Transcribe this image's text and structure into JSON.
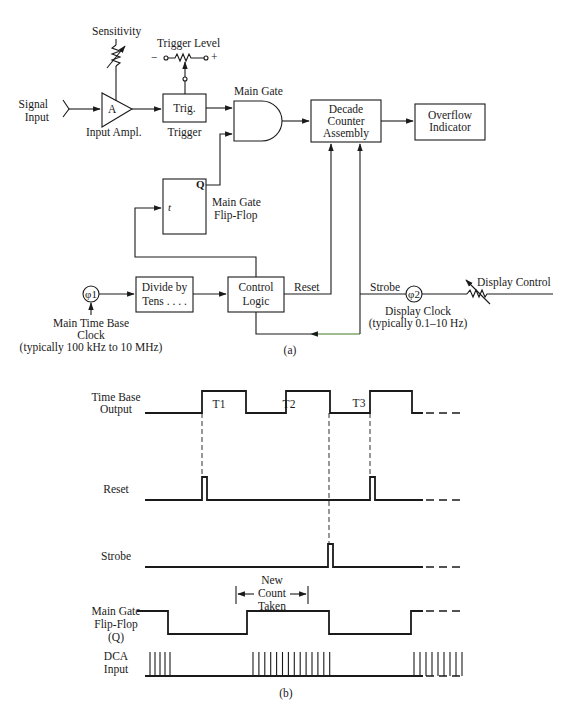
{
  "figure": {
    "part_a": {
      "caption": "(a)",
      "signal_input": [
        "Signal",
        "Input"
      ],
      "sensitivity_label": "Sensitivity",
      "amplifier_symbol": "A",
      "amplifier_label": "Input Ampl.",
      "trigger_level_label": "Trigger Level",
      "trigger_level_minus": "−",
      "trigger_level_plus": "+",
      "trigger_box": "Trig.",
      "trigger_label": "Trigger",
      "main_gate_label": "Main Gate",
      "decade_counter": [
        "Decade",
        "Counter",
        "Assembly"
      ],
      "overflow_indicator": [
        "Overflow",
        "Indicator"
      ],
      "flipflop_q": "Q",
      "flipflop_t": "t",
      "flipflop_label": [
        "Main Gate",
        "Flip-Flop"
      ],
      "clock1_symbol": "φ1",
      "clock1_label": [
        "Main Time Base",
        "Clock",
        "(typically 100 kHz to 10 MHz)"
      ],
      "divide_box": [
        "Divide by",
        "Tens . . . ."
      ],
      "control_logic": [
        "Control",
        "Logic"
      ],
      "reset_label": "Reset",
      "strobe_label": "Strobe",
      "clock2_symbol": "φ2",
      "clock2_label": [
        "Display Clock",
        "(typically 0.1–10 Hz)"
      ],
      "display_control_label": "Display Control"
    },
    "part_b": {
      "caption": "(b)",
      "signals": [
        {
          "name": "time-base-output",
          "label": [
            "Time Base",
            "Output"
          ]
        },
        {
          "name": "reset",
          "label": [
            "Reset"
          ]
        },
        {
          "name": "strobe",
          "label": [
            "Strobe"
          ]
        },
        {
          "name": "main-gate-flipflop",
          "label": [
            "Main Gate",
            "Flip-Flop",
            "(Q)"
          ]
        },
        {
          "name": "dca-input",
          "label": [
            "DCA",
            "Input"
          ]
        }
      ],
      "pulse_labels": [
        "T1",
        "T2",
        "T3"
      ],
      "count_annotation": [
        "New",
        "Count",
        "Taken"
      ],
      "time_axis": {
        "start": 0,
        "end": 100,
        "ellipsis_end": 130
      },
      "time_base_pulses": [
        [
          0,
          0
        ],
        [
          57,
          101
        ],
        [
          141,
          185
        ],
        [
          225,
          267
        ]
      ],
      "reset_pulses": [
        57,
        225
      ],
      "strobe_pulses": [
        183
      ],
      "gate_transitions": {
        "initial_high_until": 23,
        "high_intervals": [
          [
            102,
            184
          ],
          [
            266,
            999
          ]
        ]
      },
      "dca_bursts": [
        {
          "start": 5,
          "count": 5,
          "spacing": 5
        },
        {
          "start": 108,
          "count": 14,
          "spacing": 5.9
        },
        {
          "start": 269,
          "count": 9,
          "spacing": 6
        }
      ],
      "dashed_markers": [
        57,
        184,
        225
      ]
    }
  }
}
